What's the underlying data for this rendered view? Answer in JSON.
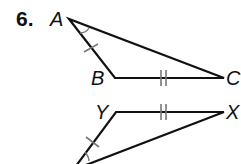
{
  "problem": {
    "number": "6."
  },
  "diagram": {
    "triangle_1": {
      "vertices": {
        "A": "A",
        "B": "B",
        "C": "C"
      },
      "marks": {
        "AB": "single tick",
        "BC": "double tick",
        "angle_A": "single arc"
      }
    },
    "triangle_2": {
      "vertices": {
        "Y": "Y",
        "X": "X"
      },
      "marks": {
        "YZ": "single tick",
        "YX": "double tick",
        "angle_Z": "single arc"
      }
    },
    "colors": {
      "line": "#111111",
      "mark": "#777777",
      "background": "#ffffff"
    }
  }
}
